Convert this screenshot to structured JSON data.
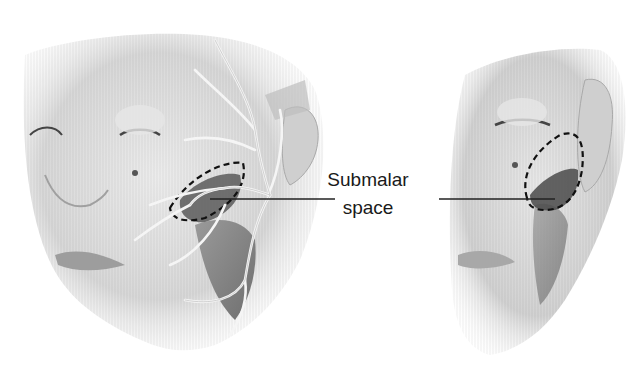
{
  "figure": {
    "label_line1": "Submalar",
    "label_line2": "space",
    "panels": [
      {
        "name": "oblique-view-face",
        "features": [
          "facial-nerve-branches",
          "masseter-muscle",
          "submalar-space-dashed-outline"
        ]
      },
      {
        "name": "lateral-view-face",
        "features": [
          "masseter-muscle",
          "submalar-space-dashed-outline"
        ]
      }
    ],
    "colors": {
      "background": "#ffffff",
      "skin_shading": "#d6d6d6",
      "nerve": "#f4f4f4",
      "submalar_fill": "#555555",
      "leader_line": "#222222",
      "text": "#1a1a1a"
    }
  }
}
